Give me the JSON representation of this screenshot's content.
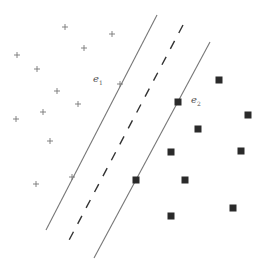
{
  "diagram": {
    "type": "svm-margin-illustration",
    "colors": {
      "background": "#ffffff",
      "line": "#777777",
      "plus": "#777777",
      "square": "#2a2a2a",
      "label": "#555555"
    },
    "lines": [
      {
        "id": "left-margin",
        "style": "solid",
        "x1": 157,
        "y1": 15,
        "x2": 46,
        "y2": 230
      },
      {
        "id": "decision-boundary",
        "style": "dashed",
        "x1": 183,
        "y1": 25,
        "x2": 67,
        "y2": 244
      },
      {
        "id": "right-margin",
        "style": "solid",
        "x1": 210,
        "y1": 42,
        "x2": 94,
        "y2": 258
      }
    ],
    "labels": [
      {
        "id": "e1",
        "base": "e",
        "sub": "1",
        "x": 93,
        "y": 74
      },
      {
        "id": "e2",
        "base": "e",
        "sub": "2",
        "x": 191,
        "y": 95
      }
    ],
    "class_plus": [
      [
        65,
        27
      ],
      [
        112,
        34
      ],
      [
        17,
        55
      ],
      [
        84,
        48
      ],
      [
        37,
        69
      ],
      [
        120,
        84
      ],
      [
        57,
        91
      ],
      [
        78,
        104
      ],
      [
        43,
        112
      ],
      [
        16,
        119
      ],
      [
        50,
        141
      ],
      [
        72,
        177
      ],
      [
        36,
        184
      ]
    ],
    "class_square": [
      [
        219,
        80
      ],
      [
        178,
        102
      ],
      [
        248,
        115
      ],
      [
        198,
        129
      ],
      [
        171,
        152
      ],
      [
        241,
        151
      ],
      [
        185,
        180
      ],
      [
        136,
        180
      ],
      [
        233,
        208
      ],
      [
        171,
        216
      ]
    ]
  }
}
